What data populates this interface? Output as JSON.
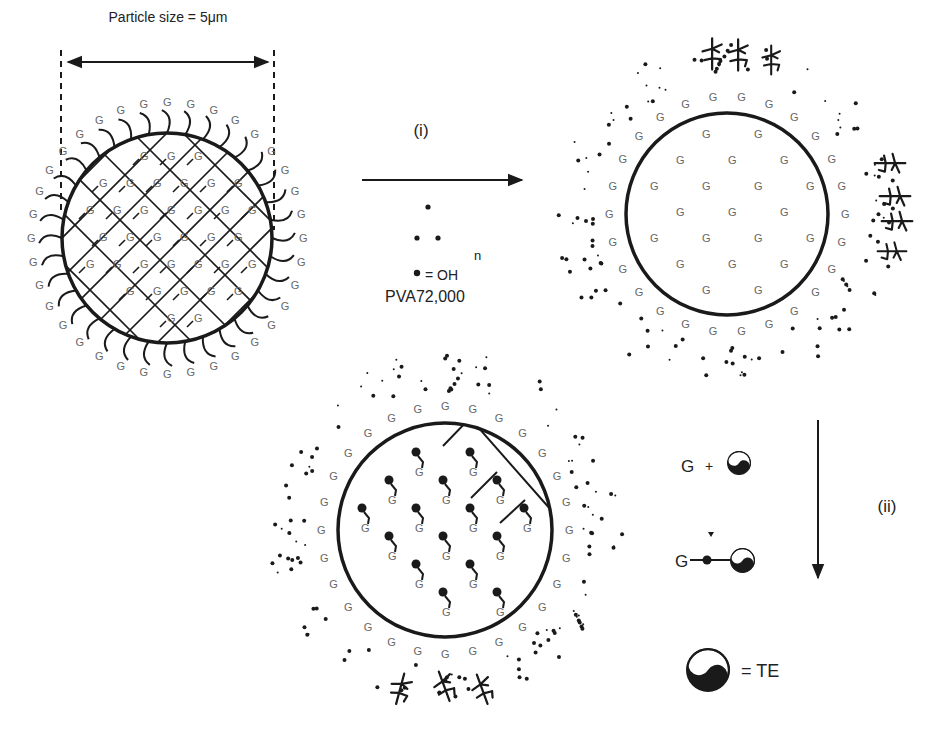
{
  "diagram": {
    "particle_size_label": "Particle size = 5μm",
    "step1_label": "(i)",
    "step2_label": "(ii)",
    "pva_n": "n",
    "pva_oh_legend": "= OH",
    "pva_name": "PVA72,000",
    "group_symbol": "G",
    "reaction_plus": "+",
    "te_legend": "= TE",
    "colors": {
      "ink": "#1a1a1a",
      "g_label": "#666666",
      "background": "#ffffff"
    },
    "panels": [
      {
        "name": "crosslinked-particle",
        "description": "Crosslinked mesh particle with surface G-terminated chains"
      },
      {
        "name": "pva-coated-particle",
        "description": "Particle after PVA treatment with G groups inside and dotted PVA shell"
      },
      {
        "name": "te-loaded-particle",
        "description": "Particle with TE-conjugated G groups"
      }
    ]
  }
}
